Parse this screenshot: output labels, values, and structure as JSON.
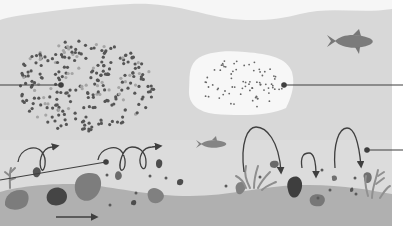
{
  "diagram": {
    "title": "",
    "colors": {
      "background": "#ffffff",
      "water": "#d6d6d6",
      "water_light": "#e3e3e3",
      "surface": "#f4f4f4",
      "bed": "#b3b3b3",
      "cloud_pale": "#f7f7f7",
      "particle_dark": "#555555",
      "particle_light": "#a5a5a5",
      "rock_dark": "#444444",
      "rock_mid": "#7c7c7c",
      "rock_light": "#8f8f8f",
      "fish": "#7d7d7d",
      "line": "#3f3f3f"
    },
    "regions": [
      {
        "id": "dense-particle-cloud",
        "label": ""
      },
      {
        "id": "fine-particle-zone",
        "label": ""
      },
      {
        "id": "rolling-particles",
        "label": ""
      },
      {
        "id": "hopping-particles",
        "label": ""
      }
    ],
    "leader_lines": [
      {
        "id": "leader-cloud",
        "target": "dense-particle-cloud",
        "side": "left"
      },
      {
        "id": "leader-fine",
        "target": "fine-particle-zone",
        "side": "right"
      },
      {
        "id": "leader-rolling",
        "target": "rolling-particles",
        "side": "left"
      },
      {
        "id": "leader-hopping",
        "target": "hopping-particles",
        "side": "right"
      }
    ],
    "fish_count": 2,
    "flow_direction": "right"
  }
}
